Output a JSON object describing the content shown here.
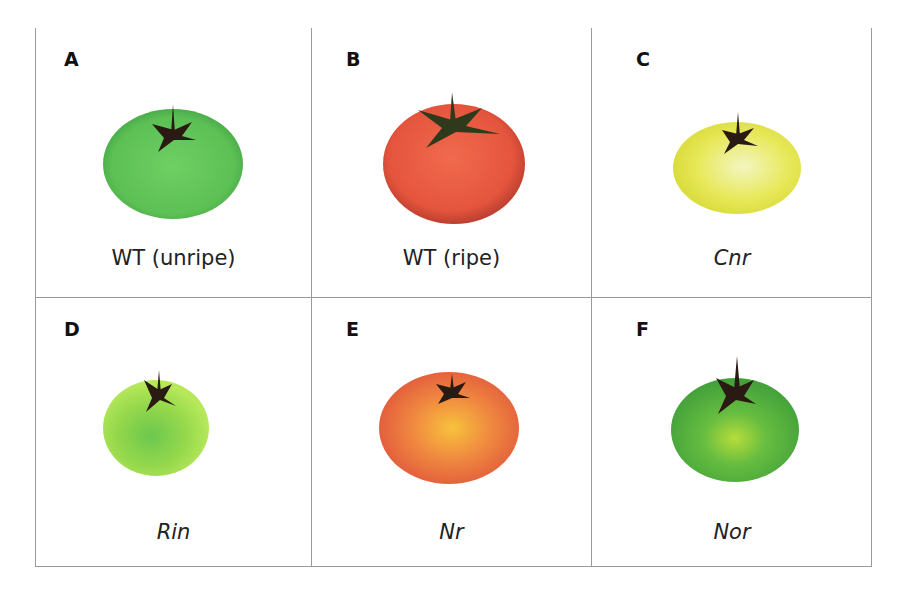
{
  "figure": {
    "panels": [
      {
        "letter": "A",
        "caption": "WT (unripe)",
        "italic": false,
        "fruit_color": "#5cc055",
        "fruit_highlight": "#6fcf63",
        "fruit_edge": "#45a544"
      },
      {
        "letter": "B",
        "caption": "WT (ripe)",
        "italic": false,
        "fruit_color": "#e5553d",
        "fruit_highlight": "#f06a4e",
        "fruit_edge": "#b23a2c"
      },
      {
        "letter": "C",
        "caption": "Cnr",
        "italic": true,
        "fruit_color": "#e8e85a",
        "fruit_highlight": "#f3f6c0",
        "fruit_edge": "#d9dc3c"
      },
      {
        "letter": "D",
        "caption": "Rin",
        "italic": true,
        "fruit_color": "#a8e04a",
        "fruit_highlight": "#6cc84e",
        "fruit_edge": "#b6e85a"
      },
      {
        "letter": "E",
        "caption": "Nr",
        "italic": true,
        "fruit_color": "#ec6a40",
        "fruit_highlight": "#f8c23c",
        "fruit_edge": "#e25a3c"
      },
      {
        "letter": "F",
        "caption": "Nor",
        "italic": true,
        "fruit_color": "#52b342",
        "fruit_highlight": "#b7dc3a",
        "fruit_edge": "#44a23a"
      }
    ],
    "stem_color": "#2a1a14"
  }
}
